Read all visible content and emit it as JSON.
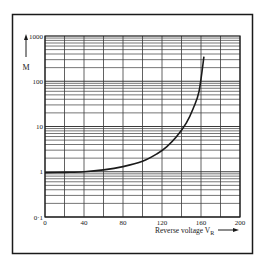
{
  "chart_data": {
    "type": "line",
    "title": "",
    "xlabel": "Reverse voltage",
    "xlabel_subscript_base": "V",
    "xlabel_subscript": "R",
    "ylabel": "M",
    "xscale": "linear",
    "yscale": "log",
    "xlim": [
      0,
      200
    ],
    "ylim": [
      0.1,
      1000
    ],
    "x_ticks": [
      0,
      40,
      80,
      120,
      160,
      200
    ],
    "x_tick_labels": [
      "0",
      "40",
      "80",
      "120",
      "160",
      "200"
    ],
    "x_grid_step": 20,
    "y_ticks": [
      0.1,
      1,
      10,
      100,
      1000
    ],
    "y_tick_labels": [
      "0·1",
      "1",
      "10",
      "100",
      "1000"
    ],
    "grid": true,
    "legend": null,
    "series": [
      {
        "name": "M vs V_R",
        "x": [
          0,
          20,
          40,
          60,
          80,
          100,
          115,
          125,
          135,
          145,
          152,
          158,
          163
        ],
        "y": [
          0.95,
          0.97,
          1.0,
          1.1,
          1.3,
          1.7,
          2.5,
          3.6,
          6.0,
          12,
          25,
          60,
          350
        ]
      }
    ]
  },
  "colors": {
    "ink": "#1a1a1a",
    "grid": "#3a3a3a",
    "background": "#ffffff"
  }
}
